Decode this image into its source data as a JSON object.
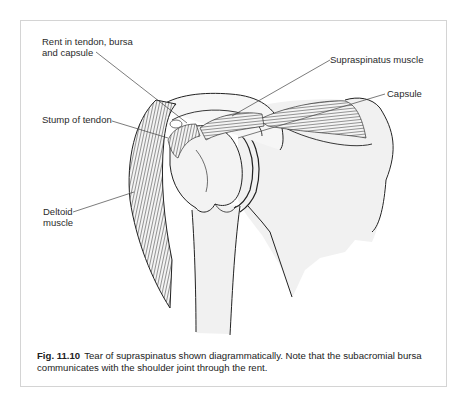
{
  "figure": {
    "labels": {
      "rent": [
        "Rent in tendon, bursa",
        "and capsule"
      ],
      "supraspinatus": "Supraspinatus muscle",
      "capsule": "Capsule",
      "stump": "Stump of tendon",
      "deltoid": [
        "Deltoid",
        "muscle"
      ]
    },
    "caption": {
      "number": "Fig. 11.10",
      "text": "Tear of supraspinatus shown diagrammatically. Note that the subacromial bursa communicates with the shoulder joint through the rent."
    }
  }
}
